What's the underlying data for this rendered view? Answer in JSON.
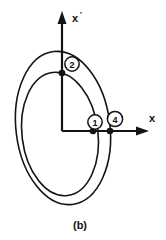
{
  "figure": {
    "caption": "(b)",
    "axes": {
      "vertical": {
        "label": "x",
        "prime": "'",
        "name": "x-prime-axis"
      },
      "horizontal": {
        "label": "x",
        "name": "x-axis"
      }
    },
    "markers": [
      {
        "id": "marker-1",
        "label": "1",
        "cx": 95,
        "cy": 122
      },
      {
        "id": "marker-2",
        "label": "2",
        "cx": 72,
        "cy": 64
      },
      {
        "id": "marker-4",
        "label": "4",
        "cx": 115,
        "cy": 119
      }
    ],
    "nodes": [
      {
        "id": "node-top",
        "cx": 62,
        "cy": 73
      },
      {
        "id": "node-inner-right",
        "cx": 93,
        "cy": 131
      },
      {
        "id": "node-outer-right",
        "cx": 110,
        "cy": 131
      }
    ],
    "orbits": [
      {
        "id": "outer-ellipse",
        "rx": 47,
        "ry": 77,
        "cx": 63,
        "cy": 128,
        "rotation": -7
      },
      {
        "id": "inner-ellipse",
        "rx": 38,
        "ry": 62,
        "cx": 60,
        "cy": 134,
        "rotation": -7
      }
    ],
    "colors": {
      "ink": "#141414",
      "background": "#ffffff"
    }
  }
}
